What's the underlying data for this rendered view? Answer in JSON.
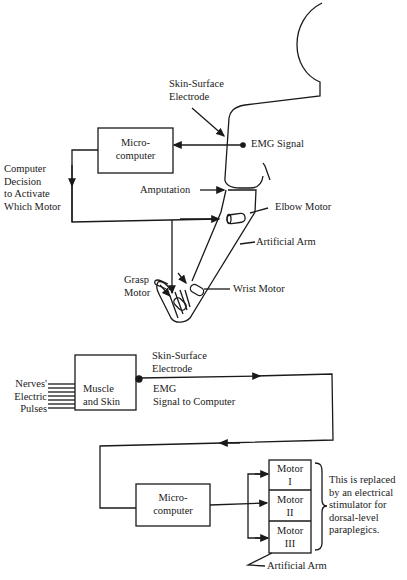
{
  "top_diagram": {
    "labels": {
      "electrode_1": "Skin-Surface",
      "electrode_2": "Electrode",
      "micro_1": "Micro-",
      "micro_2": "computer",
      "emg_signal": "EMG Signal",
      "decision_1": "Computer",
      "decision_2": "Decision",
      "decision_3": "to Activate",
      "decision_4": "Which Motor",
      "amputation": "Amputation",
      "elbow_motor": "Elbow Motor",
      "artificial_arm": "Artificial Arm",
      "grasp_1": "Grasp",
      "grasp_2": "Motor",
      "wrist_motor": "Wrist Motor"
    }
  },
  "bottom_diagram": {
    "labels": {
      "nerves_1": "Nerves'",
      "nerves_2": "Electric",
      "nerves_3": "Pulses",
      "muscle_1": "Muscle",
      "muscle_2": "and Skin",
      "electrode_1": "Skin-Surface",
      "electrode_2": "Electrode",
      "emg_1": "EMG",
      "emg_2": "Signal to Computer",
      "micro_1": "Micro-",
      "micro_2": "computer",
      "artificial_arm": "Artificial Arm",
      "note_1": "This is replaced",
      "note_2": "by an electrical",
      "note_3": "stimulator for",
      "note_4": "dorsal-level",
      "note_5": "paraplegics."
    },
    "motors": [
      {
        "line1": "Motor",
        "line2": "I"
      },
      {
        "line1": "Motor",
        "line2": "II"
      },
      {
        "line1": "Motor",
        "line2": "III"
      }
    ]
  }
}
